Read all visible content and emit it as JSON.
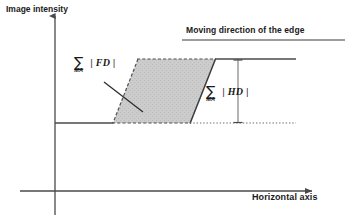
{
  "figure": {
    "type": "diagram"
  },
  "axes": {
    "y_label": "Image intensity",
    "x_label": "Horizontal axis",
    "y_axis_x": 55,
    "x_axis_y": 191
  },
  "annotations": {
    "moving_direction": "Moving direction of the edge",
    "fd": {
      "sum_symbol": "∑",
      "subscript": "MA",
      "term": "| FD |"
    },
    "hd": {
      "sum_symbol": "∑",
      "subscript": "MA",
      "term": "| HD |"
    }
  },
  "shape": {
    "name": "edge-parallelogram",
    "fill": "#c9c9c9",
    "stroke": "#3a3a3a",
    "top_left": [
      138,
      59
    ],
    "top_right": [
      215,
      59
    ],
    "bottom_right": [
      190,
      123
    ],
    "bottom_left": [
      113,
      123
    ]
  },
  "colors": {
    "line": "#4a4a4a",
    "text": "#1a1a1a",
    "shade": "#c9c9c9"
  }
}
